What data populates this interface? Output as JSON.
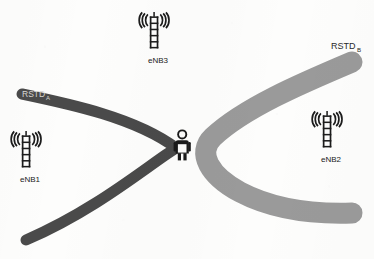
{
  "figure": {
    "kind": "otdoa-rstd-positioning-diagram",
    "background_color": "#fdfdfc"
  },
  "curves": [
    {
      "id": "rstd-a",
      "label": "RSTD",
      "label_subscript": "A",
      "label_color": "#d8d8d4",
      "color": "#4a4a4a",
      "description": "dark grey hyperbola opening to the left"
    },
    {
      "id": "rstd-b",
      "label": "RSTD",
      "label_subscript": "B",
      "label_color": "#2a2a2a",
      "color": "#9a9a9a",
      "description": "light grey hyperbola opening to the right"
    }
  ],
  "towers": [
    {
      "id": "enb3",
      "label": "eNB3",
      "icon": "cell-tower-icon",
      "position": "top-center"
    },
    {
      "id": "enb1",
      "label": "eNB1",
      "icon": "cell-tower-icon",
      "position": "left"
    },
    {
      "id": "enb2",
      "label": "eNB2",
      "icon": "cell-tower-icon",
      "position": "right"
    }
  ],
  "user_equipment": {
    "id": "ue",
    "icon": "person-with-phone-icon",
    "color": "#1a1a1a",
    "device_color": "#fbfbfa"
  },
  "colors": {
    "dark_curve": "#4a4a4a",
    "light_curve": "#9a9a9a",
    "tower_ink": "#1c1c1c",
    "label_ink": "#1a1a1a",
    "background": "#fdfdfc"
  }
}
